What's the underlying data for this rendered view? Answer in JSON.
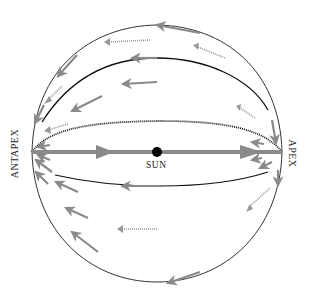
{
  "diagram": {
    "type": "celestial-sphere-solar-motion",
    "labels": {
      "sun": "SUN",
      "apex": "APEX",
      "antapex": "ANTAPEX"
    },
    "colors": {
      "arrow": "#8a8a8a",
      "line": "#1a1a1a",
      "sun": "#000000",
      "background": "#ffffff"
    },
    "elements": [
      {
        "name": "sphere-outline",
        "kind": "circle"
      },
      {
        "name": "sun",
        "kind": "dot",
        "label": "SUN"
      },
      {
        "name": "apex-antapex-axis",
        "kind": "thick-arrow-line",
        "direction": "toward-apex"
      },
      {
        "name": "dotted-equator",
        "kind": "dotted-arc"
      },
      {
        "name": "upper-meridian",
        "kind": "solid-arc"
      },
      {
        "name": "lower-meridian",
        "kind": "solid-arc"
      },
      {
        "name": "apparent-motion-arrows",
        "kind": "arrows",
        "direction": "toward-antapex"
      }
    ]
  }
}
